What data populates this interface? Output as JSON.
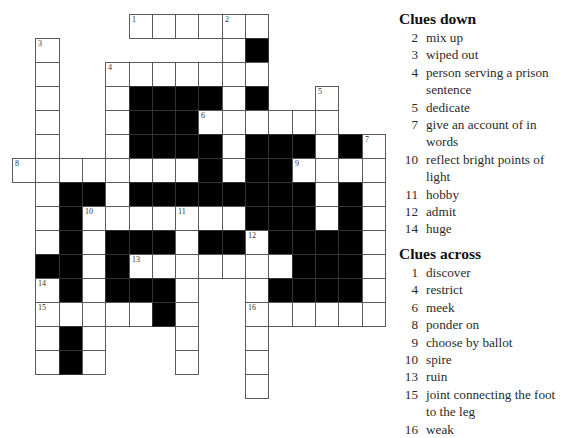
{
  "puzzle": {
    "grid": {
      "origin_x": 12,
      "origin_y": 14,
      "cell_w": 23.3,
      "cell_h": 24,
      "legend": {
        ".": "empty",
        "W": "white",
        "#": "black"
      },
      "rows": [
        ".....WWWWWW.....",
        ".W.......W#.....",
        ".W..WWWWWWW.....",
        ".W..W####W#..W..",
        ".W..W###WWWWWW..",
        ".W..W####W###W#W",
        "WWWWWWWW#W##WWWW",
        ".W##W########W#W",
        ".W#WWWWWWW###W#W",
        ".W#W###W##W####W",
        ".##W#WWWWWWW###W",
        ".W#W###W..W####W",
        ".WWWWW#W..WWWWWW",
        ".W#W...W..W.....",
        ".W#W...W..W.....",
        "..........W....."
      ],
      "numbers": [
        {
          "n": "1",
          "r": 0,
          "c": 5
        },
        {
          "n": "2",
          "r": 0,
          "c": 9
        },
        {
          "n": "3",
          "r": 1,
          "c": 1
        },
        {
          "n": "4",
          "r": 2,
          "c": 4
        },
        {
          "n": "5",
          "r": 3,
          "c": 13
        },
        {
          "n": "6",
          "r": 4,
          "c": 8
        },
        {
          "n": "7",
          "r": 5,
          "c": 15
        },
        {
          "n": "8",
          "r": 6,
          "c": 0
        },
        {
          "n": "9",
          "r": 6,
          "c": 12
        },
        {
          "n": "10",
          "r": 8,
          "c": 3
        },
        {
          "n": "11",
          "r": 8,
          "c": 7
        },
        {
          "n": "12",
          "r": 9,
          "c": 10
        },
        {
          "n": "13",
          "r": 10,
          "c": 5
        },
        {
          "n": "14",
          "r": 11,
          "c": 1
        },
        {
          "n": "15",
          "r": 12,
          "c": 1
        },
        {
          "n": "16",
          "r": 12,
          "c": 10
        }
      ]
    },
    "clues_down": {
      "heading": "Clues down",
      "items": [
        {
          "n": "2",
          "text": "mix up"
        },
        {
          "n": "3",
          "text": "wiped out"
        },
        {
          "n": "4",
          "text": "person serving a prison sentence"
        },
        {
          "n": "5",
          "text": "dedicate"
        },
        {
          "n": "7",
          "text": "give an account of in words"
        },
        {
          "n": "10",
          "text": "reflect bright points of light"
        },
        {
          "n": "11",
          "text": "hobby"
        },
        {
          "n": "12",
          "text": "admit"
        },
        {
          "n": "14",
          "text": "huge"
        }
      ]
    },
    "clues_across": {
      "heading": "Clues across",
      "items": [
        {
          "n": "1",
          "text": "discover"
        },
        {
          "n": "4",
          "text": "restrict"
        },
        {
          "n": "6",
          "text": "meek"
        },
        {
          "n": "8",
          "text": "ponder on"
        },
        {
          "n": "9",
          "text": "choose by ballot"
        },
        {
          "n": "10",
          "text": "spire"
        },
        {
          "n": "13",
          "text": "ruin"
        },
        {
          "n": "15",
          "text": "joint connecting the foot to the leg"
        },
        {
          "n": "16",
          "text": "weak"
        }
      ]
    }
  }
}
